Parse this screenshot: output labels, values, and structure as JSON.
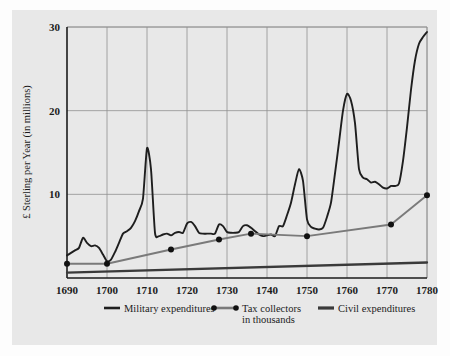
{
  "chart_data": {
    "type": "line",
    "title": "",
    "xlabel": "",
    "ylabel": "£ Sterling per Year (in millions)",
    "xlim": [
      1690,
      1780
    ],
    "ylim": [
      0,
      30
    ],
    "yticks": [
      10,
      20,
      30
    ],
    "ytick_labels": [
      "10",
      "20",
      "30"
    ],
    "xticks": [
      1690,
      1700,
      1710,
      1720,
      1730,
      1740,
      1750,
      1760,
      1770,
      1780
    ],
    "xtick_labels": [
      "1690",
      "1700",
      "1710",
      "1720",
      "1730",
      "1740",
      "1750",
      "1760",
      "1770",
      "1780"
    ],
    "grid": true,
    "legend_position": "bottom",
    "series": [
      {
        "name": "Military expenditures",
        "color": "#1e1e1e",
        "marker": "none",
        "x": [
          1690,
          1691,
          1692,
          1693,
          1694,
          1695,
          1696,
          1697,
          1698,
          1699,
          1700,
          1701,
          1702,
          1703,
          1704,
          1705,
          1706,
          1707,
          1708,
          1709,
          1710,
          1711,
          1712,
          1713,
          1714,
          1715,
          1716,
          1717,
          1718,
          1719,
          1720,
          1721,
          1722,
          1723,
          1724,
          1725,
          1726,
          1727,
          1728,
          1729,
          1730,
          1731,
          1732,
          1733,
          1734,
          1735,
          1736,
          1737,
          1738,
          1739,
          1740,
          1741,
          1742,
          1743,
          1744,
          1745,
          1746,
          1747,
          1748,
          1749,
          1750,
          1751,
          1752,
          1753,
          1754,
          1755,
          1756,
          1757,
          1758,
          1759,
          1760,
          1761,
          1762,
          1763,
          1764,
          1765,
          1766,
          1767,
          1768,
          1769,
          1770,
          1771,
          1772,
          1773,
          1774,
          1775,
          1776,
          1777,
          1778,
          1779,
          1780
        ],
        "y": [
          2.7,
          3.0,
          3.3,
          3.6,
          4.8,
          4.2,
          3.8,
          3.9,
          3.6,
          2.8,
          2.0,
          2.2,
          3.1,
          4.2,
          5.3,
          5.6,
          6.0,
          6.8,
          8.0,
          9.5,
          15.5,
          13.0,
          5.4,
          5.0,
          5.2,
          5.3,
          5.1,
          5.4,
          5.5,
          5.4,
          6.5,
          6.7,
          6.2,
          5.4,
          5.3,
          5.3,
          5.3,
          5.3,
          6.4,
          6.2,
          5.5,
          5.4,
          5.4,
          5.5,
          6.2,
          6.3,
          6.0,
          5.6,
          5.2,
          5.0,
          5.1,
          5.2,
          5.0,
          6.2,
          6.2,
          7.5,
          9.0,
          11.2,
          13.0,
          11.6,
          7.0,
          6.1,
          5.9,
          5.8,
          6.0,
          7.3,
          9.0,
          12.5,
          16.2,
          20.0,
          22.0,
          21.2,
          18.5,
          13.0,
          12.0,
          11.8,
          11.4,
          11.5,
          11.2,
          10.8,
          10.7,
          11.0,
          11.0,
          11.3,
          14.0,
          18.0,
          22.5,
          26.0,
          28.0,
          28.8,
          29.4
        ]
      },
      {
        "name": "Tax collectors in thousands",
        "color": "#7a7a7a",
        "marker": "dot",
        "x": [
          1690,
          1700,
          1716,
          1728,
          1736,
          1750,
          1771,
          1780
        ],
        "y": [
          1.7,
          1.7,
          3.4,
          4.6,
          5.3,
          5.0,
          6.4,
          9.9
        ],
        "marker_points": [
          {
            "x": 1690,
            "y": 1.7
          },
          {
            "x": 1700,
            "y": 1.7
          },
          {
            "x": 1716,
            "y": 3.4
          },
          {
            "x": 1728,
            "y": 4.6
          },
          {
            "x": 1736,
            "y": 5.3
          },
          {
            "x": 1750,
            "y": 5.0
          },
          {
            "x": 1771,
            "y": 6.4
          },
          {
            "x": 1780,
            "y": 9.9
          }
        ]
      },
      {
        "name": "Civil expenditures",
        "color": "#3a3a3a",
        "marker": "none",
        "x": [
          1690,
          1780
        ],
        "y": [
          0.65,
          1.85
        ]
      }
    ],
    "legend": [
      {
        "label": "Military expenditures",
        "color": "#1e1e1e",
        "style": "line"
      },
      {
        "label": "Tax collectors",
        "label2": "in thousands",
        "color": "#7a7a7a",
        "style": "line-dots"
      },
      {
        "label": "Civil expenditures",
        "color": "#3a3a3a",
        "style": "line-thick"
      }
    ]
  },
  "colors": {
    "panel_bg": "#e8e8e8",
    "page_bg": "#fdfdfd",
    "grid": "#8f8f8f",
    "axis": "#1b1b1b",
    "military": "#1e1e1e",
    "tax": "#7a7a7a",
    "civil": "#3a3a3a"
  }
}
